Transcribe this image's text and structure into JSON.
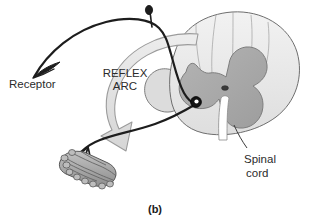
{
  "figure": {
    "caption": "(b)",
    "labels": {
      "receptor": "Receptor",
      "reflex_line1": "REFLEX",
      "reflex_line2": "ARC",
      "spinal_line1": "Spinal",
      "spinal_line2": "cord"
    },
    "colors": {
      "background": "#ffffff",
      "white_matter": "#e9e9e9",
      "gray_matter": "#a9a9a9",
      "pia_rim": "#8f8f8f",
      "nerve": "#1d1d1d",
      "arrow_fill": "#e2e2e2",
      "arrow_stroke": "#9a9a9a",
      "muscle_fill": "#b0b0b0",
      "muscle_stroke": "#5a5a5a",
      "text": "#2b2b2b",
      "outline": "#6e6e6e"
    },
    "parts": {
      "spinal_cord": "spinal-cord-cross-section",
      "gray_matter": "butterfly-gray-matter",
      "central_canal": "central-canal",
      "ventral_fissure": "ventral-median-fissure",
      "sensory_neuron": "sensory-afferent-neuron",
      "motor_neuron": "motor-efferent-neuron",
      "dorsal_root_ganglion": "dorsal-root-ganglion",
      "synapse_cell_body": "motor-neuron-cell-body",
      "receptor_ending": "sensory-receptor-ending",
      "effector_muscle": "skeletal-muscle-bundle",
      "reflex_arrow": "reflex-arc-direction-arrow",
      "leader_line": "spinal-cord-leader-line"
    }
  }
}
